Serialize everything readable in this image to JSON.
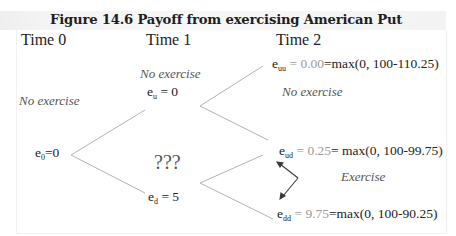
{
  "figure": {
    "title": "Figure 14.6 Payoff from exercising American Put"
  },
  "columns": [
    {
      "label": "Time 0"
    },
    {
      "label": "Time 1"
    },
    {
      "label": "Time 2"
    }
  ],
  "time0": {
    "note": "No exercise",
    "node": {
      "symbol": "e",
      "subscript": "0",
      "value": "=0"
    }
  },
  "time1": {
    "up": {
      "note": "No exercise",
      "symbol": "e",
      "subscript": "u",
      "value": " = 0"
    },
    "down": {
      "symbol": "e",
      "subscript": "d",
      "value": " = 5"
    },
    "question": "???"
  },
  "time2": {
    "uu": {
      "symbol": "e",
      "subscript": "uu",
      "eq": " = ",
      "value": "0.00",
      "formula": "=max(0, 100-110.25)"
    },
    "uu_note": "No exercise",
    "ud": {
      "symbol": "e",
      "subscript": "ud",
      "eq": " = ",
      "value": "0.25",
      "formula": "= max(0, 100-99.75)"
    },
    "dd": {
      "symbol": "e",
      "subscript": "dd",
      "eq": " = ",
      "value": "9.75",
      "formula": "=max(0, 100-90.25)"
    },
    "exercise_note": "Exercise"
  },
  "colors": {
    "line": "#b0b0b0",
    "text": "#222222",
    "value_grey": "#9a9a9a",
    "title_bg": "#f3f3f3",
    "arrow": "#333333"
  }
}
